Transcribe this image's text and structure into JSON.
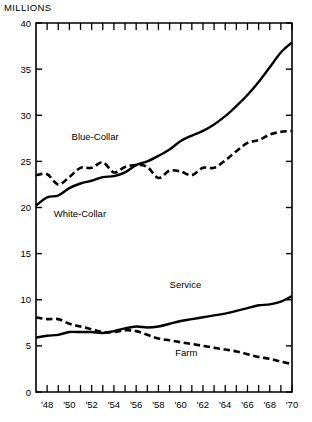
{
  "chart_data": {
    "type": "line",
    "title": "",
    "ylabel": "MILLIONS",
    "xlabel": "",
    "ylim": [
      0,
      40
    ],
    "xlim": [
      1947,
      1970
    ],
    "ytick_labels": [
      "0",
      "5",
      "10",
      "15",
      "20",
      "25",
      "30",
      "35",
      "40"
    ],
    "yticks": [
      0,
      5,
      10,
      15,
      20,
      25,
      30,
      35,
      40
    ],
    "xtick_labels": [
      "'48",
      "'50",
      "'52",
      "'54",
      "'56",
      "'58",
      "'60",
      "'62",
      "'64",
      "'66",
      "'68",
      "'70"
    ],
    "xticks_labeled": [
      1948,
      1950,
      1952,
      1954,
      1956,
      1958,
      1960,
      1962,
      1964,
      1966,
      1968,
      1970
    ],
    "xticks_minor": [
      1948,
      1949,
      1950,
      1951,
      1952,
      1953,
      1954,
      1955,
      1956,
      1957,
      1958,
      1959,
      1960,
      1961,
      1962,
      1963,
      1964,
      1965,
      1966,
      1967,
      1968,
      1969,
      1970
    ],
    "grid": false,
    "legend_position": "inline-annotations",
    "x": [
      1947,
      1948,
      1949,
      1950,
      1951,
      1952,
      1953,
      1954,
      1955,
      1956,
      1957,
      1958,
      1959,
      1960,
      1961,
      1962,
      1963,
      1964,
      1965,
      1966,
      1967,
      1968,
      1969,
      1970
    ],
    "series": [
      {
        "name": "White-Collar",
        "style": "solid",
        "color": "#000000",
        "label": "White-Collar",
        "values": [
          20.2,
          21.1,
          21.3,
          22.1,
          22.6,
          22.9,
          23.3,
          23.4,
          23.8,
          24.6,
          25.0,
          25.6,
          26.3,
          27.2,
          27.8,
          28.3,
          29.0,
          29.9,
          31.0,
          32.2,
          33.6,
          35.2,
          36.8,
          37.9
        ]
      },
      {
        "name": "Blue-Collar",
        "style": "dashed",
        "color": "#000000",
        "label": "Blue-Collar",
        "values": [
          23.5,
          23.6,
          22.5,
          23.3,
          24.3,
          24.3,
          24.9,
          23.8,
          24.4,
          24.6,
          24.4,
          23.2,
          24.0,
          23.9,
          23.5,
          24.3,
          24.3,
          25.1,
          26.1,
          27.0,
          27.3,
          27.9,
          28.2,
          28.3
        ]
      },
      {
        "name": "Service",
        "style": "solid",
        "color": "#000000",
        "label": "Service",
        "values": [
          5.9,
          6.1,
          6.2,
          6.5,
          6.5,
          6.5,
          6.4,
          6.6,
          6.9,
          7.1,
          7.0,
          7.1,
          7.4,
          7.7,
          7.9,
          8.1,
          8.3,
          8.5,
          8.8,
          9.1,
          9.4,
          9.5,
          9.8,
          10.4
        ]
      },
      {
        "name": "Farm",
        "style": "dashed",
        "color": "#000000",
        "label": "Farm",
        "values": [
          8.1,
          7.9,
          7.9,
          7.4,
          7.1,
          6.8,
          6.5,
          6.5,
          6.7,
          6.6,
          6.2,
          5.8,
          5.6,
          5.4,
          5.2,
          5.0,
          4.8,
          4.6,
          4.4,
          4.1,
          3.8,
          3.6,
          3.3,
          3.0
        ]
      }
    ],
    "annotations": [
      {
        "text": "Blue-Collar",
        "x": 1950.2,
        "y": 27.3,
        "series": "Blue-Collar"
      },
      {
        "text": "White-Collar",
        "x": 1948.6,
        "y": 19.0,
        "series": "White-Collar"
      },
      {
        "text": "Service",
        "x": 1959.0,
        "y": 11.3,
        "series": "Service"
      },
      {
        "text": "Farm",
        "x": 1959.5,
        "y": 3.9,
        "series": "Farm"
      }
    ]
  }
}
